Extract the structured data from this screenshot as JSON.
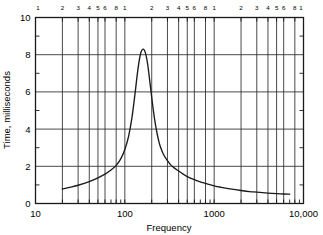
{
  "chart_data": {
    "type": "line",
    "title": "",
    "xlabel": "Frequency",
    "ylabel": "Time, milliseconds",
    "xscale": "log",
    "yscale": "linear",
    "xlim": [
      10,
      10000
    ],
    "ylim": [
      0,
      10
    ],
    "grid": true,
    "legend": null,
    "x_tick_labels": [
      "10",
      "100",
      "1000",
      "10,000"
    ],
    "x_tick_values": [
      10,
      100,
      1000,
      10000
    ],
    "y_tick_labels": [
      "0",
      "2",
      "4",
      "6",
      "8",
      "10"
    ],
    "y_tick_values": [
      0,
      2,
      4,
      6,
      8,
      10
    ],
    "y_minor_ticks": [
      1,
      3,
      5,
      7,
      9
    ],
    "top_axis_minor_labels": [
      "1",
      "2",
      "3",
      "4",
      "5",
      "6",
      "8",
      "1",
      "2",
      "3",
      "4",
      "5",
      "6",
      "8",
      "1",
      "2",
      "3",
      "4",
      "5",
      "6",
      "8",
      "1"
    ],
    "top_axis_minor_values": [
      10,
      20,
      30,
      40,
      50,
      60,
      80,
      100,
      200,
      300,
      400,
      500,
      600,
      800,
      1000,
      2000,
      3000,
      4000,
      5000,
      6000,
      8000,
      10000
    ],
    "vertical_gridline_values": [
      20,
      30,
      40,
      50,
      60,
      80,
      100,
      200,
      300,
      400,
      500,
      600,
      800,
      1000,
      2000,
      3000,
      4000,
      5000,
      6000,
      8000
    ],
    "series": [
      {
        "name": "Time vs Frequency",
        "x": [
          20,
          25,
          30,
          40,
          50,
          60,
          70,
          80,
          90,
          100,
          110,
          120,
          130,
          140,
          150,
          160,
          170,
          180,
          190,
          200,
          210,
          220,
          230,
          240,
          250,
          270,
          300,
          330,
          360,
          400,
          450,
          500,
          600,
          700,
          800,
          1000,
          1200,
          1500,
          2000,
          2500,
          3000,
          4000,
          5000,
          6000,
          7000
        ],
        "y": [
          0.78,
          0.88,
          0.98,
          1.18,
          1.38,
          1.58,
          1.8,
          2.05,
          2.4,
          2.9,
          3.6,
          4.6,
          5.9,
          7.2,
          8.05,
          8.3,
          8.1,
          7.5,
          6.6,
          5.7,
          4.9,
          4.25,
          3.75,
          3.35,
          3.05,
          2.65,
          2.3,
          2.05,
          1.9,
          1.75,
          1.58,
          1.45,
          1.28,
          1.16,
          1.08,
          0.95,
          0.87,
          0.79,
          0.7,
          0.64,
          0.61,
          0.56,
          0.53,
          0.51,
          0.5
        ]
      }
    ],
    "peak": {
      "x": 160,
      "y": 8.3
    }
  },
  "axes": {
    "x_title": "Frequency",
    "y_title": "Time, milliseconds"
  }
}
